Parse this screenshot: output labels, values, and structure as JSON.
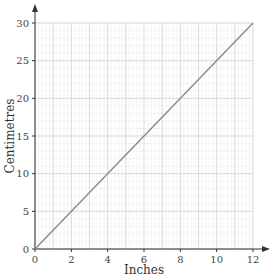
{
  "chart_data": {
    "type": "line",
    "title": "",
    "xlabel": "Inches",
    "ylabel": "Centimetres",
    "xlim": [
      0,
      12
    ],
    "ylim": [
      0,
      30
    ],
    "x_ticks": [
      0,
      2,
      4,
      6,
      8,
      10,
      12
    ],
    "y_ticks": [
      0,
      5,
      10,
      15,
      20,
      25,
      30
    ],
    "grid": true,
    "series": [
      {
        "name": "Inches to centimetres",
        "x": [
          0,
          12
        ],
        "values": [
          0,
          30
        ],
        "color": "#8a8a8a"
      }
    ]
  },
  "colors": {
    "axis": "#333333",
    "grid_major": "#d4d4d4",
    "grid_minor": "#ececec",
    "line": "#8a8a8a"
  }
}
